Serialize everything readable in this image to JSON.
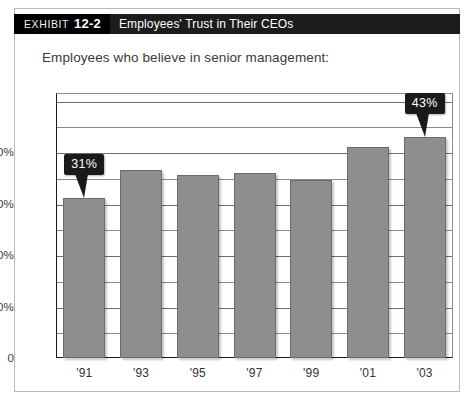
{
  "header": {
    "kicker": "EXHIBIT",
    "number": "12-2",
    "title": "Employees' Trust in Their CEOs",
    "band_color": "#1c1c1c",
    "tag_color": "#000000"
  },
  "subtitle": "Employees who believe in senior management:",
  "chart_data": {
    "type": "bar",
    "title": "Employees' Trust in Their CEOs",
    "subtitle": "Employees who believe in senior management:",
    "xlabel": "",
    "ylabel": "",
    "categories": [
      "'91",
      "'93",
      "'95",
      "'97",
      "'99",
      "'01",
      "'03"
    ],
    "values": [
      31,
      36.5,
      35.5,
      36,
      34.5,
      41,
      43
    ],
    "ylim": [
      0,
      51.5
    ],
    "ytick_values": [
      0,
      10,
      20,
      30,
      40
    ],
    "ytick_labels": [
      "0",
      "10%",
      "20%",
      "30%",
      "40%"
    ],
    "minor_tick_step": 5,
    "grid": true,
    "legend": null,
    "bar_color": "#8e8e8e",
    "annotations": [
      {
        "category": "'91",
        "label": "31%",
        "value": 31
      },
      {
        "category": "'03",
        "label": "43%",
        "value": 43
      }
    ]
  }
}
